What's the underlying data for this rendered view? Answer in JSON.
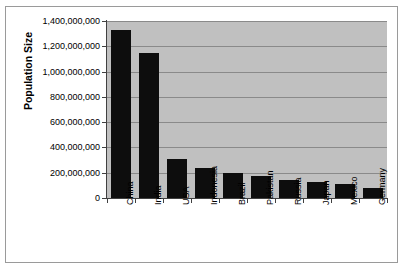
{
  "chart_data": {
    "type": "bar",
    "title": "",
    "xlabel": "",
    "ylabel": "Population Size",
    "categories": [
      "China",
      "India",
      "USA",
      "Indonesia",
      "Brazil",
      "Pakistan",
      "Russia",
      "Japan",
      "Mexico",
      "Germany"
    ],
    "values": [
      1330000000,
      1150000000,
      310000000,
      240000000,
      195000000,
      175000000,
      140000000,
      127000000,
      112000000,
      82000000
    ],
    "series": [
      {
        "name": "Population Size",
        "values": [
          1330000000,
          1150000000,
          310000000,
          240000000,
          195000000,
          175000000,
          140000000,
          127000000,
          112000000,
          82000000
        ]
      }
    ],
    "ylim": [
      0,
      1400000000
    ],
    "ytick_values": [
      0,
      200000000,
      400000000,
      600000000,
      800000000,
      1000000000,
      1200000000,
      1400000000
    ],
    "ytick_labels": [
      "0",
      "200,000,000",
      "400,000,000",
      "600,000,000",
      "800,000,000",
      "1,000,000,000",
      "1,200,000,000",
      "1,400,000,000"
    ],
    "grid": true,
    "legend": false,
    "legend_position": "none",
    "bar_color": "#0d0d0d",
    "plot_background_color": "#c0c0c0",
    "figure_background_color": "#ffffff",
    "gridline_color": "#8a8a8a",
    "axis_color": "#404040",
    "frame_border_color": "#9a9a9a",
    "xtick_label_rotation": -90
  },
  "axis": {
    "y_title": "Population Size"
  }
}
